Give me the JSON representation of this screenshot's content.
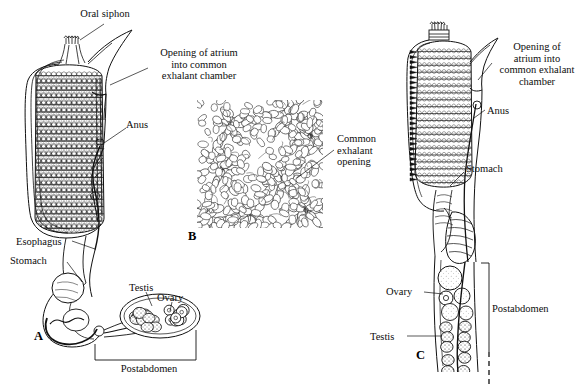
{
  "figure": {
    "background_color": "#ffffff",
    "ink_color": "#111111",
    "width": 581,
    "height": 389
  },
  "panels": [
    {
      "letter": "A",
      "name": "single-zooid-lateral-view",
      "letter_x": 34,
      "letter_y": 329
    },
    {
      "letter": "B",
      "name": "colony-surface-view",
      "letter_x": 188,
      "letter_y": 229
    },
    {
      "letter": "C",
      "name": "zooid-with-postabdomen",
      "letter_x": 416,
      "letter_y": 348
    }
  ],
  "labels": {
    "oral_siphon": "Oral siphon",
    "opening_atrium_a": "Opening of atrium\ninto common\nexhalant chamber",
    "anus_a": "Anus",
    "esophagus": "Esophagus",
    "stomach_a": "Stomach",
    "testis_a": "Testis",
    "ovary_a": "Ovary",
    "postabdomen_a": "Postabdomen",
    "common_exhalant_opening": "Common\nexhalant\nopening",
    "opening_atrium_c": "Opening of\natrium into\ncommon exhalant\nchamber",
    "anus_c": "Anus",
    "stomach_c": "Stomach",
    "ovary_c": "Ovary",
    "testis_c": "Testis",
    "postabdomen_c": "Postabdomen"
  },
  "label_positions": {
    "oral_siphon": {
      "x": 60,
      "y": 8,
      "w": 90,
      "align": "center"
    },
    "opening_atrium_a": {
      "x": 150,
      "y": 47,
      "w": 98,
      "align": "center"
    },
    "anus_a": {
      "x": 126,
      "y": 119,
      "w": 34,
      "align": "left"
    },
    "esophagus": {
      "x": 16,
      "y": 236,
      "w": 58,
      "align": "left"
    },
    "stomach_a": {
      "x": 10,
      "y": 255,
      "w": 58,
      "align": "left"
    },
    "testis_a": {
      "x": 129,
      "y": 282,
      "w": 34,
      "align": "left"
    },
    "ovary_a": {
      "x": 157,
      "y": 292,
      "w": 34,
      "align": "left"
    },
    "postabdomen_a": {
      "x": 110,
      "y": 363,
      "w": 78,
      "align": "center"
    },
    "common_exhalant_opening": {
      "x": 337,
      "y": 133,
      "w": 60,
      "align": "left"
    },
    "opening_atrium_c": {
      "x": 494,
      "y": 41,
      "w": 86,
      "align": "center"
    },
    "anus_c": {
      "x": 487,
      "y": 105,
      "w": 34,
      "align": "left"
    },
    "stomach_c": {
      "x": 466,
      "y": 163,
      "w": 52,
      "align": "left"
    },
    "ovary_c": {
      "x": 386,
      "y": 286,
      "w": 38,
      "align": "left"
    },
    "testis_c": {
      "x": 370,
      "y": 331,
      "w": 36,
      "align": "left"
    },
    "postabdomen_c": {
      "x": 492,
      "y": 303,
      "w": 74,
      "align": "left"
    }
  },
  "structures": {
    "panel_a": {
      "pharyngeal_basket_rows": 22,
      "stigmata_per_row": 13,
      "gonad_testis_lobules": 14,
      "gonad_ovary_follicles": 9
    },
    "panel_b": {
      "systems": 6,
      "zooids_visible": "many",
      "description": "colony surface showing zooids arranged in systems around common exhalant openings"
    },
    "panel_c": {
      "pharyngeal_basket_rows": 20,
      "stomach_ribs": 7,
      "testis_lobules": 12,
      "ovary_follicles": 3
    }
  }
}
